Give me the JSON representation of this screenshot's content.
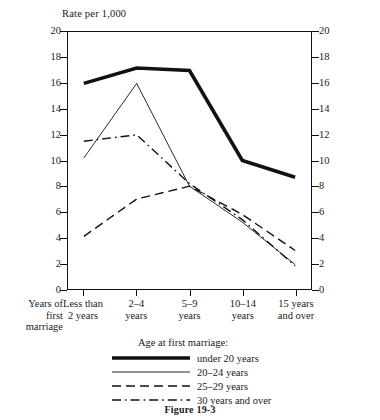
{
  "figure": {
    "caption": "Figure 19-3",
    "y_axis_title": "Rate per 1,000",
    "corner_label_lines": [
      "Years of",
      "first",
      "marriage"
    ],
    "legend_title": "Age at first marriage:"
  },
  "chart_data": {
    "type": "line",
    "title": "",
    "subtitle": "",
    "xlabel": "Years of first marriage",
    "ylabel": "Rate per 1,000",
    "ylim": [
      0,
      20
    ],
    "yticks": [
      0,
      2,
      4,
      6,
      8,
      10,
      12,
      14,
      16,
      18,
      20
    ],
    "ytick_labels": [
      "0",
      "2",
      "4",
      "6",
      "8",
      "10",
      "12",
      "14",
      "16",
      "18",
      "20"
    ],
    "grid": false,
    "dual_y_axis": true,
    "legend_position": "bottom",
    "legend_title": "Age at first marriage:",
    "categories": [
      "Less than 2 years",
      "2–4 years",
      "5–9 years",
      "10–14 years",
      "15 years and over"
    ],
    "category_label_lines": [
      [
        "Less than",
        "2 years"
      ],
      [
        "2–4",
        "years"
      ],
      [
        "5–9",
        "years"
      ],
      [
        "10–14",
        "years"
      ],
      [
        "15 years",
        "and over"
      ]
    ],
    "series": [
      {
        "name": "under 20 years",
        "style": "thick-solid",
        "values": [
          16.0,
          17.2,
          17.0,
          10.0,
          8.7
        ]
      },
      {
        "name": "20–24 years",
        "style": "thin-solid",
        "values": [
          10.2,
          16.0,
          8.0,
          5.2,
          1.9
        ]
      },
      {
        "name": "25–29 years",
        "style": "dashed",
        "values": [
          4.1,
          7.0,
          8.0,
          5.8,
          3.0
        ]
      },
      {
        "name": "30 years and over",
        "style": "dash-dot",
        "values": [
          11.5,
          12.0,
          8.2,
          5.4,
          1.8
        ]
      }
    ]
  },
  "colors": {
    "axis": "#111111",
    "line": "#111111",
    "background": "#ffffff"
  }
}
